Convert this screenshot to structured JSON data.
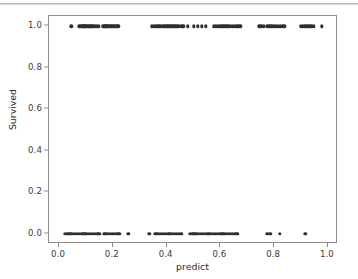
{
  "chart_data": {
    "type": "scatter",
    "title": "",
    "xlabel": "predict",
    "ylabel": "Survived",
    "xlim": [
      -0.0374,
      1.0374
    ],
    "ylim": [
      -0.05,
      1.05
    ],
    "grid": false,
    "legend": null,
    "xticks": [
      0.0,
      0.2,
      0.4,
      0.6,
      0.8,
      1.0
    ],
    "xtick_labels": [
      "0.0",
      "0.2",
      "0.4",
      "0.6",
      "0.8",
      "1.0"
    ],
    "yticks": [
      0.0,
      0.2,
      0.4,
      0.6,
      0.8,
      1.0
    ],
    "ytick_labels": [
      "0.0",
      "0.2",
      "0.4",
      "0.6",
      "0.8",
      "1.0"
    ],
    "marker_color": "#2f2f2f",
    "marker_size": 3.4,
    "series": [
      {
        "name": "observations",
        "x": [
          0.045,
          0.075,
          0.081,
          0.086,
          0.09,
          0.094,
          0.098,
          0.102,
          0.106,
          0.11,
          0.114,
          0.118,
          0.122,
          0.127,
          0.134,
          0.141,
          0.148,
          0.163,
          0.168,
          0.172,
          0.176,
          0.18,
          0.185,
          0.19,
          0.195,
          0.2,
          0.205,
          0.21,
          0.216,
          0.221,
          0.345,
          0.352,
          0.359,
          0.366,
          0.373,
          0.379,
          0.385,
          0.39,
          0.395,
          0.4,
          0.405,
          0.41,
          0.415,
          0.42,
          0.425,
          0.43,
          0.436,
          0.443,
          0.455,
          0.462,
          0.478,
          0.5,
          0.515,
          0.53,
          0.545,
          0.575,
          0.583,
          0.59,
          0.597,
          0.604,
          0.611,
          0.618,
          0.625,
          0.632,
          0.639,
          0.646,
          0.653,
          0.66,
          0.667,
          0.674,
          0.745,
          0.752,
          0.762,
          0.775,
          0.782,
          0.789,
          0.796,
          0.803,
          0.81,
          0.817,
          0.824,
          0.831,
          0.838,
          0.898,
          0.906,
          0.913,
          0.92,
          0.927,
          0.934,
          0.941,
          0.948,
          0.978
        ],
        "y": [
          1,
          1,
          1,
          1,
          1,
          1,
          1,
          1,
          1,
          1,
          1,
          1,
          1,
          1,
          1,
          1,
          1,
          1,
          1,
          1,
          1,
          1,
          1,
          1,
          1,
          1,
          1,
          1,
          1,
          1,
          1,
          1,
          1,
          1,
          1,
          1,
          1,
          1,
          1,
          1,
          1,
          1,
          1,
          1,
          1,
          1,
          1,
          1,
          1,
          1,
          1,
          1,
          1,
          1,
          1,
          1,
          1,
          1,
          1,
          1,
          1,
          1,
          1,
          1,
          1,
          1,
          1,
          1,
          1,
          1,
          1,
          1,
          1,
          1,
          1,
          1,
          1,
          1,
          1,
          1,
          1,
          1,
          1,
          1,
          1,
          1,
          1,
          1,
          1,
          1,
          1,
          1
        ]
      },
      {
        "name": "observations-zero",
        "x": [
          0.022,
          0.03,
          0.038,
          0.046,
          0.054,
          0.062,
          0.07,
          0.078,
          0.086,
          0.094,
          0.102,
          0.11,
          0.118,
          0.126,
          0.134,
          0.142,
          0.15,
          0.168,
          0.176,
          0.184,
          0.192,
          0.2,
          0.208,
          0.216,
          0.224,
          0.258,
          0.335,
          0.358,
          0.366,
          0.374,
          0.382,
          0.39,
          0.398,
          0.406,
          0.414,
          0.422,
          0.43,
          0.438,
          0.446,
          0.455,
          0.487,
          0.495,
          0.503,
          0.511,
          0.519,
          0.527,
          0.535,
          0.543,
          0.551,
          0.559,
          0.567,
          0.575,
          0.583,
          0.591,
          0.599,
          0.607,
          0.615,
          0.623,
          0.631,
          0.639,
          0.647,
          0.655,
          0.663,
          0.775,
          0.786,
          0.822,
          0.916
        ],
        "y": [
          0,
          0,
          0,
          0,
          0,
          0,
          0,
          0,
          0,
          0,
          0,
          0,
          0,
          0,
          0,
          0,
          0,
          0,
          0,
          0,
          0,
          0,
          0,
          0,
          0,
          0,
          0,
          0,
          0,
          0,
          0,
          0,
          0,
          0,
          0,
          0,
          0,
          0,
          0,
          0,
          0,
          0,
          0,
          0,
          0,
          0,
          0,
          0,
          0,
          0,
          0,
          0,
          0,
          0,
          0,
          0,
          0,
          0,
          0,
          0,
          0,
          0,
          0,
          0,
          0,
          0,
          0
        ]
      }
    ]
  }
}
